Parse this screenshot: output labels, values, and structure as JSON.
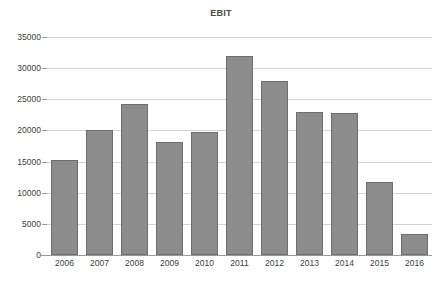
{
  "chart_data": {
    "type": "bar",
    "title": "EBIT",
    "xlabel": "",
    "ylabel": "",
    "categories": [
      "2006",
      "2007",
      "2008",
      "2009",
      "2010",
      "2011",
      "2012",
      "2013",
      "2014",
      "2015",
      "2016"
    ],
    "values": [
      15300,
      20100,
      24300,
      18100,
      19700,
      32000,
      28000,
      22900,
      22800,
      11700,
      3400
    ],
    "ylim": [
      0,
      35000
    ],
    "y_ticks": [
      0,
      5000,
      10000,
      15000,
      20000,
      25000,
      30000,
      35000
    ],
    "y_tick_labels": [
      "0",
      "5000",
      "10000",
      "15000",
      "20000",
      "25000",
      "30000",
      "35000"
    ],
    "grid": true,
    "legend": false,
    "series": [
      {
        "name": "EBIT",
        "values": [
          15300,
          20100,
          24300,
          18100,
          19700,
          32000,
          28000,
          22900,
          22800,
          11700,
          3400
        ]
      }
    ],
    "colors": {
      "bar_fill": "#8c8c8c",
      "bar_border": "#6e6e6e",
      "gridline": "#d4d4d4",
      "axis": "#9a9a9a",
      "text": "#3d3d3d",
      "title": "#4a4a4a",
      "background": "#ffffff"
    }
  }
}
